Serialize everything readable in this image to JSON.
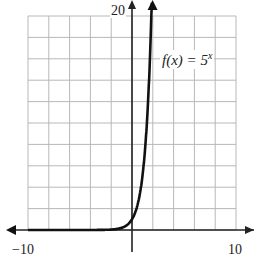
{
  "chart_data": {
    "type": "line",
    "title": "",
    "function_label": "f(x) = 5^x",
    "function_label_parts": {
      "lhs": "f(x) = 5",
      "exponent": "x"
    },
    "series": [
      {
        "name": "f(x) = 5^x",
        "x": [
          -10,
          -8,
          -6,
          -4,
          -2,
          -1,
          0,
          0.5,
          1,
          1.5,
          1.86
        ],
        "values": [
          1e-07,
          2.6e-06,
          6.4e-05,
          0.0016,
          0.04,
          0.2,
          1,
          2.24,
          5,
          11.18,
          20
        ]
      }
    ],
    "xlim": [
      -10,
      10
    ],
    "ylim": [
      0,
      20
    ],
    "x_tick_labels": [
      "-10",
      "10"
    ],
    "y_tick_labels": [
      "20"
    ],
    "grid": true,
    "grid_step": {
      "x": 2,
      "y": 2
    },
    "xlabel": "",
    "ylabel": "",
    "legend": "none",
    "colors": {
      "curve": "#111111",
      "grid": "#b8b8b8",
      "axis": "#222222"
    }
  },
  "labels": {
    "y_max": "20",
    "x_min": "−10",
    "x_max": "10",
    "func_lhs": "f(x) = 5",
    "func_exp": "x"
  }
}
